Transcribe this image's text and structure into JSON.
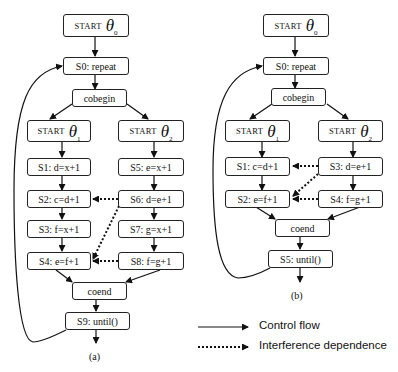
{
  "diagram_a": {
    "caption": "(a)",
    "start0": {
      "kw": "START",
      "sym": "θ",
      "sub": "0"
    },
    "s0": "S0: repeat",
    "cobegin": "cobegin",
    "start1": {
      "kw": "START",
      "sym": "θ",
      "sub": "1"
    },
    "start2": {
      "kw": "START",
      "sym": "θ",
      "sub": "2"
    },
    "s1": "S1: d=x+1",
    "s2": "S2: c=d+1",
    "s3": "S3: f=x+1",
    "s4": "S4: e=f+1",
    "s5": "S5: e=x+1",
    "s6": "S6: d=e+1",
    "s7": "S7: g=x+1",
    "s8": "S8: f=g+1",
    "coend": "coend",
    "s9": "S9: until()"
  },
  "diagram_b": {
    "caption": "(b)",
    "start0": {
      "kw": "START",
      "sym": "θ",
      "sub": "0"
    },
    "s0": "S0: repeat",
    "cobegin": "cobegin",
    "start1": {
      "kw": "START",
      "sym": "θ",
      "sub": "1"
    },
    "start2": {
      "kw": "START",
      "sym": "θ",
      "sub": "2"
    },
    "s1": "S1: c=d+1",
    "s2": "S2: e=f+1",
    "s3": "S3: d=e+1",
    "s4": "S4: f=g+1",
    "coend": "coend",
    "s5": "S5: until()"
  },
  "legend": {
    "control_flow": "Control flow",
    "interference": "Interference dependence"
  }
}
